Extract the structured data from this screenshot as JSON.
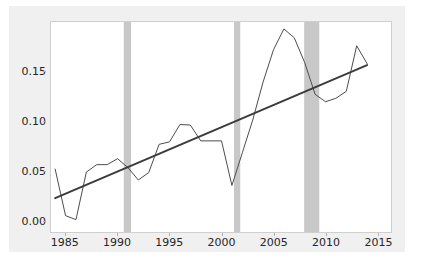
{
  "chart_data": {
    "type": "line",
    "title": "",
    "subtitle": "",
    "xlabel": "",
    "ylabel": "",
    "xlim": [
      1983.6,
      2016.3
    ],
    "ylim": [
      -0.012,
      0.2
    ],
    "grid": false,
    "legend": null,
    "legend_position": "none",
    "xticks": [
      1985,
      1990,
      1995,
      2000,
      2005,
      2010,
      2015
    ],
    "xtick_labels": [
      "1985",
      "1990",
      "1995",
      "2000",
      "2005",
      "2010",
      "2015"
    ],
    "yticks": [
      0.0,
      0.05,
      0.1,
      0.15
    ],
    "ytick_labels": [
      "0.00",
      "0.05",
      "0.10",
      "0.15"
    ],
    "series": [
      {
        "name": "observed",
        "type": "line",
        "color": "#4d4d4d",
        "width": 1.0,
        "x": [
          1984,
          1985,
          1986,
          1987,
          1988,
          1989,
          1990,
          1991,
          1992,
          1993,
          1994,
          1995,
          1996,
          1997,
          1998,
          1999,
          2000,
          2001,
          2002,
          2003,
          2004,
          2005,
          2006,
          2007,
          2008,
          2009,
          2010,
          2011,
          2012,
          2013,
          2014
        ],
        "values": [
          0.0515,
          0.0045,
          0.0005,
          0.0485,
          0.056,
          0.056,
          0.062,
          0.053,
          0.0405,
          0.048,
          0.0765,
          0.079,
          0.0965,
          0.096,
          0.08,
          0.08,
          0.08,
          0.035,
          0.068,
          0.101,
          0.1395,
          0.172,
          0.193,
          0.184,
          0.159,
          0.127,
          0.1195,
          0.123,
          0.13,
          0.176,
          0.158
        ]
      },
      {
        "name": "trend",
        "type": "line",
        "color": "#3b3b3b",
        "width": 2.0,
        "x": [
          1984,
          2014
        ],
        "values": [
          0.0222,
          0.1565
        ]
      }
    ],
    "shaded_bands": [
      {
        "name": "recession-1990-1991",
        "x0": 1990.6,
        "x1": 1991.3,
        "color": "#c8c8c8",
        "opacity": 1.0
      },
      {
        "name": "recession-2001",
        "x0": 2001.2,
        "x1": 2001.8,
        "color": "#c8c8c8",
        "opacity": 1.0
      },
      {
        "name": "recession-2008-2009",
        "x0": 2007.95,
        "x1": 2009.4,
        "color": "#c8c8c8",
        "opacity": 1.0
      }
    ],
    "colors": {
      "figure_background": "#f0f0f0",
      "axes_background": "#ffffff",
      "axes_border": "#cfcfcf",
      "tick_text": "#262626",
      "band": "#c8c8c8",
      "data_line": "#4d4d4d",
      "trend_line": "#3b3b3b"
    }
  }
}
